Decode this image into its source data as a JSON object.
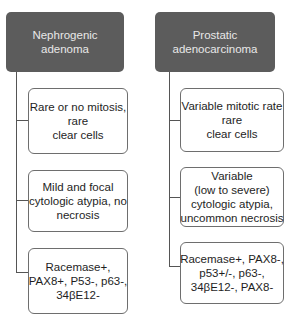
{
  "diagram": {
    "columns": [
      {
        "header": {
          "lines": [
            "Nephrogenic",
            "adenoma"
          ],
          "bg_color": "#5c5c5c",
          "text_color": "#e8e8e8"
        },
        "items": [
          {
            "lines": [
              "Rare or no mitosis,",
              "rare",
              "clear cells"
            ]
          },
          {
            "lines": [
              "Mild and focal",
              "cytologic atypia, no",
              "necrosis"
            ]
          },
          {
            "lines": [
              "Racemase+,",
              "PAX8+, P53-, p63-,",
              "34βE12-"
            ]
          }
        ]
      },
      {
        "header": {
          "lines": [
            "Prostatic",
            "adenocarcinoma"
          ],
          "bg_color": "#5c5c5c",
          "text_color": "#e8e8e8"
        },
        "items": [
          {
            "lines": [
              "Variable mitotic rate",
              "rare",
              "clear cells"
            ]
          },
          {
            "lines": [
              "Variable",
              "(low to severe)",
              "cytologic atypia,",
              "uncommon necrosis"
            ]
          },
          {
            "lines": [
              "Racemase+, PAX8-,",
              "p53+/-, p63-,",
              "34βE12-, PAX8-"
            ]
          }
        ]
      }
    ]
  }
}
